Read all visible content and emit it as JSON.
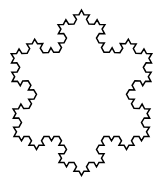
{
  "figure": {
    "name": "koch-snowflake",
    "title": "",
    "caption": "",
    "type": "fractal-curve",
    "shape": "koch-snowflake",
    "iterations": 3,
    "base_polygon_sides": 3,
    "main_points": 6,
    "orientation": "point-up",
    "filled": false,
    "background_color": "#ffffff",
    "stroke_color": "#000000",
    "stroke_width": 1.5,
    "geometry": {
      "canvas_width": 162,
      "canvas_height": 189,
      "bounding_box": {
        "x_min": 13,
        "y_min": 10,
        "x_max": 150,
        "y_max": 178
      },
      "triangle_vertices": [
        {
          "x": 81.5,
          "y": 10
        },
        {
          "x": 149.0,
          "y": 136.5
        },
        {
          "x": 14.0,
          "y": 136.5
        }
      ],
      "side_length": 135,
      "segment_count": 192
    }
  }
}
